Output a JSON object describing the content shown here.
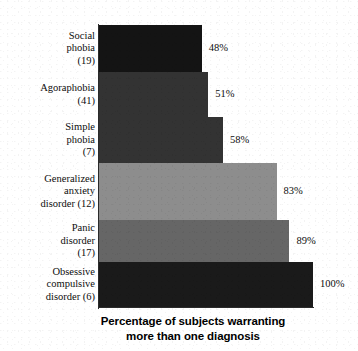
{
  "chart_data": {
    "type": "bar",
    "orientation": "horizontal",
    "title": "",
    "xlabel": "Percentage of subjects warranting more than one diagnosis",
    "xlabel_lines": [
      "Percentage of subjects warranting",
      "more than one diagnosis"
    ],
    "ylabel": "Primary diagnosis and number of subjects",
    "categories": [
      "Social phobia (19)",
      "Agoraphobia (41)",
      "Simple phobia (7)",
      "Generalized anxiety disorder (12)",
      "Panic disorder (17)",
      "Obsessive compulsive disorder (6)"
    ],
    "values": [
      48,
      51,
      58,
      83,
      89,
      100
    ],
    "value_labels": [
      "48%",
      "51%",
      "58%",
      "83%",
      "89%",
      "100%"
    ],
    "xlim": [
      0,
      100
    ],
    "grid": false,
    "legend": "none",
    "bars": [
      {
        "category": "Social phobia (19)",
        "label_lines": [
          "Social",
          "phobia",
          "(19)"
        ],
        "diagnosis": "Social phobia",
        "n_subjects": 19,
        "value": 48,
        "value_label": "48%",
        "color": "#141414",
        "top": 0,
        "height": 47
      },
      {
        "category": "Agoraphobia (41)",
        "label_lines": [
          "Agoraphobia",
          "(41)"
        ],
        "diagnosis": "Agoraphobia",
        "n_subjects": 41,
        "value": 51,
        "value_label": "51%",
        "color": "#333333",
        "top": 47,
        "height": 45
      },
      {
        "category": "Simple phobia (7)",
        "label_lines": [
          "Simple",
          "phobia",
          "(7)"
        ],
        "diagnosis": "Simple phobia",
        "n_subjects": 7,
        "value": 58,
        "value_label": "58%",
        "color": "#333333",
        "top": 92,
        "height": 46
      },
      {
        "category": "Generalized anxiety disorder (12)",
        "label_lines": [
          "Generalized",
          "anxiety",
          "disorder (12)"
        ],
        "diagnosis": "Generalized anxiety disorder",
        "n_subjects": 12,
        "value": 83,
        "value_label": "83%",
        "color": "#8d8d8d",
        "top": 138,
        "height": 57
      },
      {
        "category": "Panic disorder (17)",
        "label_lines": [
          "Panic",
          "disorder",
          "(17)"
        ],
        "diagnosis": "Panic disorder",
        "n_subjects": 17,
        "value": 89,
        "value_label": "89%",
        "color": "#666666",
        "top": 195,
        "height": 42
      },
      {
        "category": "Obsessive compulsive disorder (6)",
        "label_lines": [
          "Obsessive",
          "compulsive",
          "disorder (6)"
        ],
        "diagnosis": "Obsessive compulsive disorder",
        "n_subjects": 6,
        "value": 100,
        "value_label": "100%",
        "color": "#1a1a1a",
        "top": 237,
        "height": 45
      }
    ],
    "colors": {
      "background": "#ffffff",
      "axis": "#2b2b2b",
      "text": "#0d0d0d"
    }
  }
}
